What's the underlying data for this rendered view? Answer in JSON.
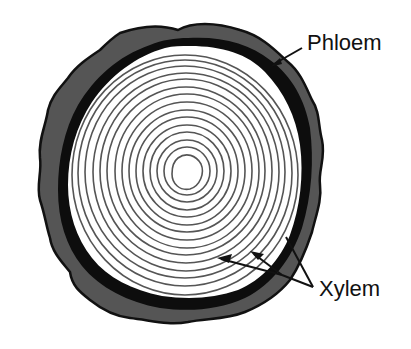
{
  "diagram": {
    "labels": {
      "phloem": "Phloem",
      "xylem": "Xylem"
    },
    "colors": {
      "background": "#ffffff",
      "bark": "#555555",
      "bark_outline": "#111111",
      "phloem_band": "#0d0d0d",
      "xylem_fill": "#ffffff",
      "growth_ring": "#555555",
      "label_text": "#111111"
    },
    "growth_ring_count": 16,
    "pointers": {
      "phloem_arrows": 1,
      "xylem_arrows": 3
    }
  }
}
